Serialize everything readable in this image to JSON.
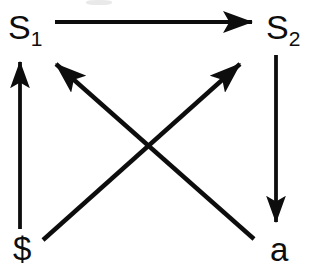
{
  "diagram": {
    "type": "state-transition-diagram",
    "title": "",
    "background_color": "#ffffff",
    "stroke_color": "#0d0d0d",
    "nodes": [
      {
        "id": "s1",
        "base": "S",
        "subscript": "1",
        "position": "top-left",
        "x": 8,
        "y": 10
      },
      {
        "id": "s2",
        "base": "S",
        "subscript": "2",
        "position": "top-right",
        "x": 266,
        "y": 10
      },
      {
        "id": "dollar",
        "base": "$",
        "subscript": "",
        "position": "bottom-left",
        "x": 13,
        "y": 232
      },
      {
        "id": "a",
        "base": "a",
        "subscript": "",
        "position": "bottom-right",
        "x": 270,
        "y": 233
      }
    ],
    "edges": [
      {
        "id": "s1-to-s2",
        "from": "s1",
        "to": "s2",
        "direction": "right",
        "x1": 55,
        "y1": 22,
        "x2": 261,
        "y2": 22
      },
      {
        "id": "dollar-to-s1",
        "from": "dollar",
        "to": "s1",
        "direction": "up",
        "x1": 20,
        "y1": 229,
        "x2": 20,
        "y2": 53
      },
      {
        "id": "s2-to-a",
        "from": "s2",
        "to": "a",
        "direction": "down",
        "x1": 276,
        "y1": 55,
        "x2": 276,
        "y2": 231
      },
      {
        "id": "dollar-to-s2",
        "from": "dollar",
        "to": "s2",
        "direction": "up-right",
        "x1": 43,
        "y1": 240,
        "x2": 249,
        "y2": 56
      },
      {
        "id": "a-to-s1",
        "from": "a",
        "to": "s1",
        "direction": "up-left",
        "x1": 254,
        "y1": 239,
        "x2": 46,
        "y2": 56
      }
    ],
    "crossing_point": {
      "x": 148,
      "y": 147
    }
  }
}
